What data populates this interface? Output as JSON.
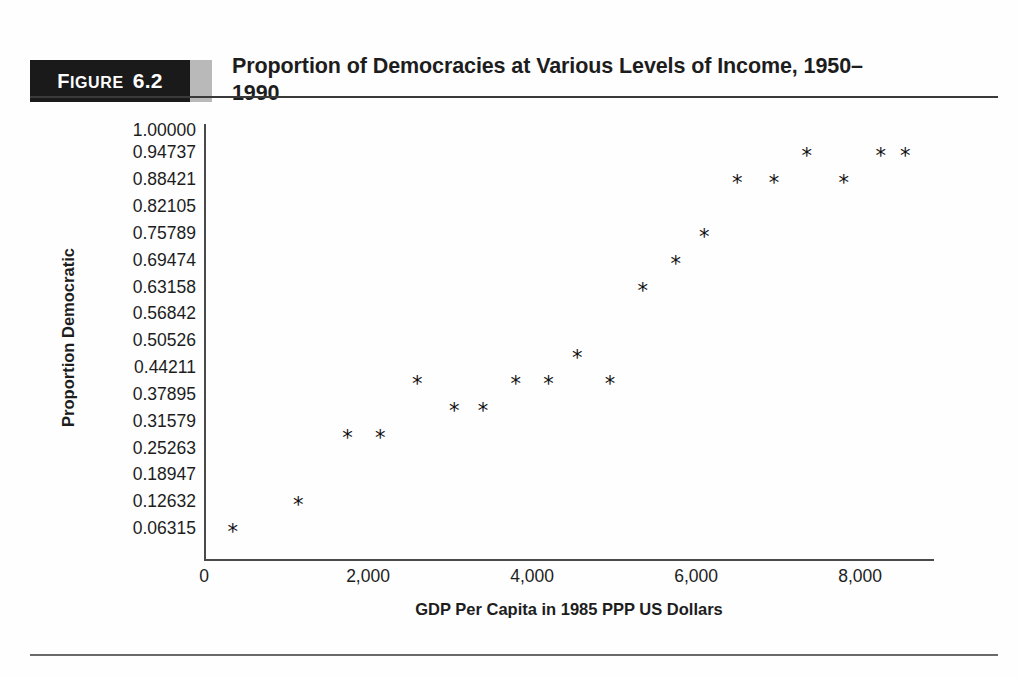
{
  "figure": {
    "badge_label": "Figure",
    "badge_number": "6.2",
    "title": "Proportion of Democracies at Various Levels of Income, 1950–1990"
  },
  "chart_data": {
    "type": "scatter",
    "title": "Proportion of Democracies at Various Levels of Income, 1950–1990",
    "xlabel": "GDP Per Capita in 1985 PPP US Dollars",
    "ylabel": "Proportion Democratic",
    "xlim": [
      0,
      8900
    ],
    "ylim": [
      0,
      1.0
    ],
    "grid": false,
    "legend": "none",
    "marker": "*",
    "marker_color": "#111111",
    "xticks": [
      0,
      2000,
      4000,
      6000,
      8000
    ],
    "xtick_labels": [
      "0",
      "2,000",
      "4,000",
      "6,000",
      "8,000"
    ],
    "ytick_labels": [
      "1.00000",
      "0.94737",
      "0.88421",
      "0.82105",
      "0.75789",
      "0.69474",
      "0.63158",
      "0.56842",
      "0.50526",
      "0.44211",
      "0.37895",
      "0.31579",
      "0.25263",
      "0.18947",
      "0.12632",
      "0.06315"
    ],
    "yticks": [
      1.0,
      0.94737,
      0.88421,
      0.82105,
      0.75789,
      0.69474,
      0.63158,
      0.56842,
      0.50526,
      0.44211,
      0.37895,
      0.31579,
      0.25263,
      0.18947,
      0.12632,
      0.06315
    ],
    "points": [
      {
        "x": 350,
        "y": 0.06315
      },
      {
        "x": 1150,
        "y": 0.12632
      },
      {
        "x": 1750,
        "y": 0.28421
      },
      {
        "x": 2150,
        "y": 0.28421
      },
      {
        "x": 2600,
        "y": 0.41053
      },
      {
        "x": 3050,
        "y": 0.34737
      },
      {
        "x": 3400,
        "y": 0.34737
      },
      {
        "x": 3800,
        "y": 0.41053
      },
      {
        "x": 4200,
        "y": 0.41053
      },
      {
        "x": 4550,
        "y": 0.47368
      },
      {
        "x": 4950,
        "y": 0.41053
      },
      {
        "x": 5350,
        "y": 0.63158
      },
      {
        "x": 5750,
        "y": 0.69474
      },
      {
        "x": 6100,
        "y": 0.75789
      },
      {
        "x": 6500,
        "y": 0.88421
      },
      {
        "x": 6950,
        "y": 0.88421
      },
      {
        "x": 7350,
        "y": 0.94737
      },
      {
        "x": 7800,
        "y": 0.88421
      },
      {
        "x": 8250,
        "y": 0.94737
      },
      {
        "x": 8550,
        "y": 0.94737
      }
    ]
  }
}
